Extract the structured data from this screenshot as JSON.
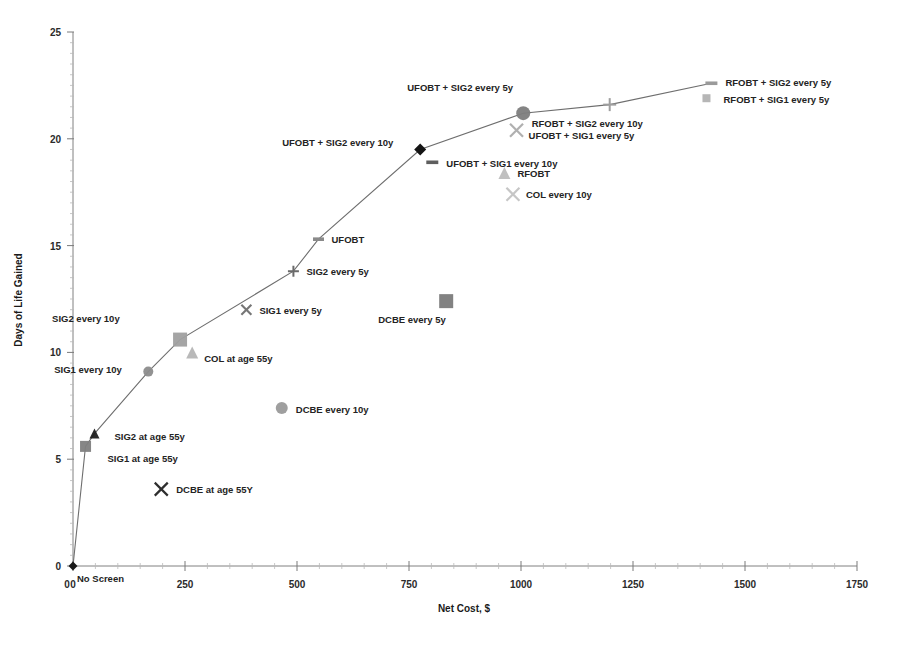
{
  "chart_data": {
    "type": "scatter",
    "title": "",
    "xlabel": "Net Cost, $",
    "ylabel": "Days of Life Gained",
    "xlim": [
      0,
      1750
    ],
    "ylim": [
      0,
      25
    ],
    "xticks": [
      0,
      250,
      500,
      750,
      1000,
      1250,
      1500,
      1750
    ],
    "xtick_labels": [
      "0",
      "250",
      "500",
      "750",
      "1000",
      "1250",
      "1500",
      "1750"
    ],
    "yticks": [
      0,
      5,
      10,
      15,
      20,
      25
    ],
    "ytick_labels": [
      "0",
      "5",
      "10",
      "15",
      "20",
      "25"
    ],
    "grid": false,
    "legend": "none (points labeled inline)",
    "origin_label": "No Screen",
    "frontier_note": "efficiency frontier line connects No Screen, SIG1 at age 55y, SIG2 at age 55y, SIG1 every 10y, SIG2 every 10y, SIG2 every 5y, UFOBT, UFOBT + SIG2 every 10y, UFOBT + SIG2 every 5y, RFOBT + SIG2 every 10y, RFOBT + SIG2 every 5y",
    "points": [
      {
        "label": "No Screen",
        "x": 0,
        "y": 0,
        "marker": "diamond",
        "color": "#1b1b1b",
        "size": 9,
        "label_dx": 4,
        "label_dy": 16,
        "on_frontier": true
      },
      {
        "label": "SIG1 at age 55y",
        "x": 28,
        "y": 5.6,
        "marker": "square",
        "color": "#7f7f7f",
        "size": 11,
        "label_dx": 22,
        "label_dy": 16,
        "on_frontier": true
      },
      {
        "label": "SIG2 at age 55y",
        "x": 48,
        "y": 6.2,
        "marker": "triangle",
        "color": "#1f1f1f",
        "size": 10,
        "label_dx": 20,
        "label_dy": 6,
        "on_frontier": true
      },
      {
        "label": "SIG1 every 10y",
        "x": 168,
        "y": 9.1,
        "marker": "circle",
        "color": "#8c8c8c",
        "size": 10,
        "label_dx": -94,
        "label_dy": 1,
        "on_frontier": true
      },
      {
        "label": "SIG2 every 10y",
        "x": 239,
        "y": 10.6,
        "marker": "square",
        "color": "#a0a0a0",
        "size": 14,
        "label_dx": -128,
        "label_dy": -18,
        "on_frontier": true
      },
      {
        "label": "COL at age 55y",
        "x": 266,
        "y": 10.0,
        "marker": "triangle",
        "color": "#b5b5b5",
        "size": 12,
        "label_dx": 12,
        "label_dy": 10,
        "on_frontier": false
      },
      {
        "label": "SIG1 every 5y",
        "x": 387,
        "y": 12.0,
        "marker": "x",
        "color": "#767676",
        "size": 10,
        "label_dx": 13,
        "label_dy": 4,
        "on_frontier": false
      },
      {
        "label": "SIG2 every 5y",
        "x": 492,
        "y": 13.8,
        "marker": "plus",
        "color": "#6a6a6a",
        "size": 11,
        "label_dx": 13,
        "label_dy": 4,
        "on_frontier": true
      },
      {
        "label": "UFOBT",
        "x": 548,
        "y": 15.3,
        "marker": "dash",
        "color": "#8a8a8a",
        "size": 11,
        "label_dx": 13,
        "label_dy": 4,
        "on_frontier": true
      },
      {
        "label": "DCBE every 10y",
        "x": 466,
        "y": 7.4,
        "marker": "circle",
        "color": "#9a9a9a",
        "size": 12,
        "label_dx": 14,
        "label_dy": 5,
        "on_frontier": false
      },
      {
        "label": "DCBE at age 55Y",
        "x": 197,
        "y": 3.6,
        "marker": "x",
        "color": "#2e2e2e",
        "size": 13,
        "label_dx": 15,
        "label_dy": 4,
        "on_frontier": false
      },
      {
        "label": "DCBE every 5y",
        "x": 833,
        "y": 12.4,
        "marker": "square",
        "color": "#7b7b7b",
        "size": 14,
        "label_dx": -68,
        "label_dy": 22,
        "on_frontier": false
      },
      {
        "label": "UFOBT + SIG2 every 10y",
        "x": 775,
        "y": 19.5,
        "marker": "diamond",
        "color": "#141414",
        "size": 12,
        "label_dx": -138,
        "label_dy": -3,
        "on_frontier": true
      },
      {
        "label": "UFOBT + SIG1 every 10y",
        "x": 802,
        "y": 18.9,
        "marker": "dash",
        "color": "#5e5e5e",
        "size": 12,
        "label_dx": 14,
        "label_dy": 5,
        "on_frontier": false
      },
      {
        "label": "UFOBT + SIG2 every 5y",
        "x": 1005,
        "y": 21.2,
        "marker": "circle",
        "color": "#7d7d7d",
        "size": 14,
        "label_dx": -116,
        "label_dy": -22,
        "on_frontier": true
      },
      {
        "label": "UFOBT + SIG1 every 5y",
        "x": 990,
        "y": 20.4,
        "marker": "x",
        "color": "#b0b0b0",
        "size": 13,
        "label_dx": 12,
        "label_dy": 9,
        "on_frontier": false
      },
      {
        "label": "RFOBT",
        "x": 963,
        "y": 18.4,
        "marker": "triangle",
        "color": "#bdbdbd",
        "size": 12,
        "label_dx": 13,
        "label_dy": 4,
        "on_frontier": false
      },
      {
        "label": "COL every 10y",
        "x": 982,
        "y": 17.4,
        "marker": "x",
        "color": "#c6c6c6",
        "size": 13,
        "label_dx": 13,
        "label_dy": 4,
        "on_frontier": false
      },
      {
        "label": "RFOBT + SIG2 every 10y",
        "x": 1198,
        "y": 21.6,
        "marker": "plus",
        "color": "#9e9e9e",
        "size": 13,
        "label_dx": -78,
        "label_dy": 22,
        "on_frontier": true
      },
      {
        "label": "RFOBT + SIG2 every 5y",
        "x": 1425,
        "y": 22.6,
        "marker": "dash",
        "color": "#9a9a9a",
        "size": 12,
        "label_dx": 14,
        "label_dy": 3,
        "on_frontier": true
      },
      {
        "label": "RFOBT + SIG1 every 5y",
        "x": 1414,
        "y": 21.9,
        "marker": "square",
        "color": "#b2b2b2",
        "size": 8,
        "label_dx": 17,
        "label_dy": 5,
        "on_frontier": false
      }
    ]
  }
}
